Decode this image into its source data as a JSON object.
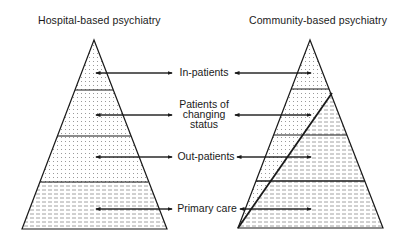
{
  "titles": {
    "left": "Hospital-based psychiatry",
    "right": "Community-based psychiatry"
  },
  "levels": [
    {
      "id": "in-patients",
      "lines": [
        "In-patients"
      ]
    },
    {
      "id": "changing-status",
      "lines": [
        "Patients of",
        "changing",
        "status"
      ]
    },
    {
      "id": "out-patients",
      "lines": [
        "Out-patients"
      ]
    },
    {
      "id": "primary-care",
      "lines": [
        "Primary care"
      ]
    }
  ],
  "patterns": {
    "dotted": "hospital-based care (dotted fill)",
    "dashed": "community-based care (dashed fill)"
  },
  "colors": {
    "line": "#1a1a1a",
    "fill_pattern": "#9a9a9a",
    "background": "#ffffff"
  }
}
